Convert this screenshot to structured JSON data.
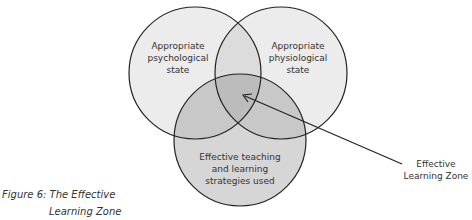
{
  "diagram": {
    "type": "venn",
    "circles": [
      {
        "id": "left",
        "label": "Appropriate psychological state",
        "lines": [
          "Appropriate",
          "psychological",
          "state"
        ]
      },
      {
        "id": "right",
        "label": "Appropriate physiological state",
        "lines": [
          "Appropriate",
          "physiological",
          "state"
        ]
      },
      {
        "id": "bottom",
        "label": "Effective teaching and learning strategies used",
        "lines": [
          "Effective teaching",
          "and learning",
          "strategies used"
        ]
      }
    ],
    "callout": {
      "lines": [
        "Effective",
        "Learning Zone"
      ],
      "points_to": "intersection of all three circles"
    },
    "colors": {
      "single": "#ececec",
      "double": "#d2d2d2",
      "triple": "#bdbdbd",
      "stroke": "#222222"
    }
  },
  "caption": {
    "line1": "Figure 6: The Effective",
    "line2": "Learning Zone"
  }
}
